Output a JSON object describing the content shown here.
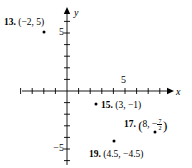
{
  "figure": {
    "background_color": "#ffffff",
    "ink_color": "#000000"
  },
  "axes": {
    "x_axis_label": "x",
    "y_axis_label": "y",
    "x_tick_label": "5",
    "y_tick_label_positive": "5",
    "y_tick_label_negative": "−5",
    "x_tick_values": [
      -4,
      -3,
      -2,
      -1,
      1,
      2,
      3,
      4,
      5,
      6,
      7,
      8,
      9,
      10,
      11,
      12
    ],
    "y_tick_values": [
      1,
      2,
      3,
      4,
      5,
      6,
      -1,
      -2,
      -3,
      -4,
      -5,
      -6
    ],
    "origin_px": {
      "x": 67,
      "y": 91
    },
    "unit_px": 11.6
  },
  "points": [
    {
      "id": "13",
      "number_label": "13.",
      "coord_text": "(−2, 5)",
      "x": -2,
      "y": 5,
      "dot_px": {
        "x": 44,
        "y": 32
      },
      "label_px": {
        "x": 4,
        "y": 18
      },
      "label_style": "plain",
      "bullet": false
    },
    {
      "id": "15",
      "number_label": "15.",
      "coord_text": "(3, −1)",
      "x": 3,
      "y": -1,
      "dot_px": {
        "x": 96,
        "y": 104
      },
      "label_px": {
        "x": 93,
        "y": 100
      },
      "label_style": "plain",
      "bullet": true
    },
    {
      "id": "17",
      "number_label": "17.",
      "coord_open": "(",
      "coord_x": "8,",
      "coord_minus": "−",
      "frac_numerator": "7",
      "frac_denominator": "2",
      "coord_close": ")",
      "coord_text": "(8, −7/2)",
      "x": 8,
      "y": -3.5,
      "dot_px": {
        "x": 155,
        "y": 132
      },
      "label_px": {
        "x": 124,
        "y": 117
      },
      "label_style": "fraction",
      "bullet": false
    },
    {
      "id": "19",
      "number_label": "19.",
      "coord_text": "(4.5, −4.5)",
      "x": 4.5,
      "y": -4.5,
      "dot_px": {
        "x": 114,
        "y": 141
      },
      "label_px": {
        "x": 89,
        "y": 148
      },
      "label_style": "plain",
      "bullet": false
    }
  ]
}
